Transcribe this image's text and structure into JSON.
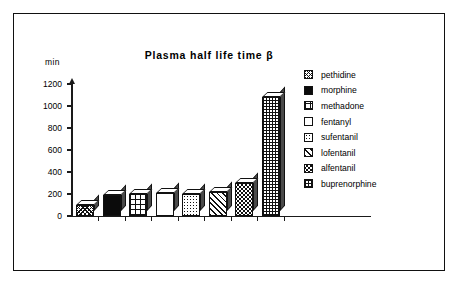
{
  "chart_data": {
    "type": "bar",
    "title": "Plasma half life time β",
    "xlabel": "",
    "ylabel": "min",
    "ylim": [
      0,
      1200
    ],
    "yticks": [
      0,
      200,
      400,
      600,
      800,
      1000,
      1200
    ],
    "grid": false,
    "legend_position": "right",
    "categories": [
      "pethidine",
      "morphine",
      "methadone",
      "fentanyl",
      "sufentanil",
      "lofentanil",
      "alfentanil",
      "buprenorphine"
    ],
    "values": [
      100,
      190,
      200,
      210,
      200,
      220,
      300,
      1080
    ],
    "series": [
      {
        "name": "Plasma half life time β",
        "values": [
          100,
          190,
          200,
          210,
          200,
          220,
          300,
          1080
        ]
      }
    ],
    "patterns": [
      "cross-hatch-diagonal",
      "solid-black",
      "grid-coarse",
      "white-empty",
      "dotted",
      "diagonal-hatch",
      "checker-dots",
      "grid-fine"
    ]
  },
  "axis": {
    "unit_label": "min",
    "tick_1200": "1200",
    "tick_1000": "1000",
    "tick_800": "800",
    "tick_600": "600",
    "tick_400": "400",
    "tick_200": "200",
    "tick_0": "0"
  },
  "legend": {
    "items": [
      {
        "label": "pethidine",
        "pattern": "cross-hatch-diagonal"
      },
      {
        "label": "morphine",
        "pattern": "solid-black"
      },
      {
        "label": "methadone",
        "pattern": "grid-coarse"
      },
      {
        "label": "fentanyl",
        "pattern": "white-empty"
      },
      {
        "label": "sufentanil",
        "pattern": "dotted"
      },
      {
        "label": "lofentanil",
        "pattern": "diagonal-hatch"
      },
      {
        "label": "alfentanil",
        "pattern": "checker-dots"
      },
      {
        "label": "buprenorphine",
        "pattern": "grid-fine"
      }
    ]
  },
  "colors": {
    "ink": "#111111",
    "background": "#ffffff",
    "bar_side": "#4a4a4a"
  }
}
